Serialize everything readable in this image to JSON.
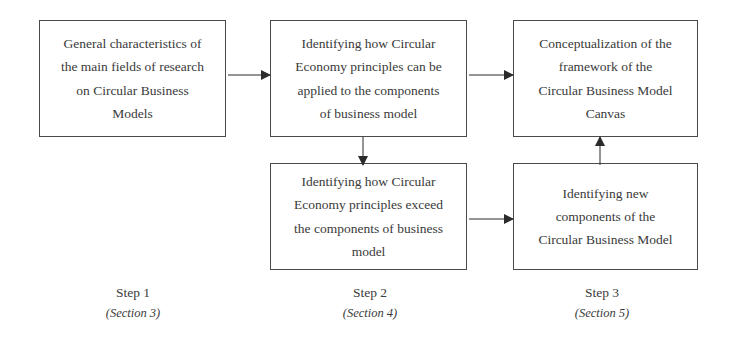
{
  "diagram": {
    "background_color": "#ffffff",
    "line_color": "#2b2b2b",
    "box_border_color": "#4a4a4a",
    "text_color": "#3a3a3a"
  },
  "nodes": [
    {
      "id": "node-1",
      "lines": [
        "General characteristics of",
        "the main fields of research",
        "on Circular Business",
        "Models"
      ]
    },
    {
      "id": "node-2",
      "lines": [
        "Identifying how Circular",
        "Economy principles can be",
        "applied to the components",
        "of business model"
      ]
    },
    {
      "id": "node-3",
      "lines": [
        "Conceptualization of the",
        "framework of the",
        "Circular Business Model",
        "Canvas"
      ]
    },
    {
      "id": "node-5",
      "lines": [
        "Identifying how Circular",
        "Economy principles exceed",
        "the components of business",
        "model"
      ]
    },
    {
      "id": "node-6",
      "lines": [
        "Identifying new",
        "components of the",
        "Circular Business Model"
      ]
    }
  ],
  "connectors": [
    {
      "id": "conn-1-2",
      "from": "node-1",
      "to": "node-2",
      "direction": "right"
    },
    {
      "id": "conn-2-3",
      "from": "node-2",
      "to": "node-3",
      "direction": "right"
    },
    {
      "id": "conn-2-5",
      "from": "node-2",
      "to": "node-5",
      "direction": "down"
    },
    {
      "id": "conn-5-6",
      "from": "node-5",
      "to": "node-6",
      "direction": "right"
    },
    {
      "id": "conn-6-3",
      "from": "node-6",
      "to": "node-3",
      "direction": "up"
    }
  ],
  "steps": [
    {
      "id": "step-1",
      "title": "Step 1",
      "section": "(Section 3)"
    },
    {
      "id": "step-2",
      "title": "Step 2",
      "section": "(Section 4)"
    },
    {
      "id": "step-3",
      "title": "Step 3",
      "section": "(Section 5)"
    }
  ]
}
